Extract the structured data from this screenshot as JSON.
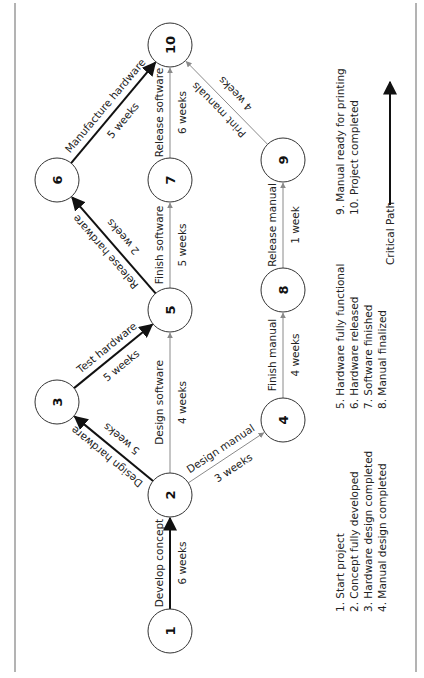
{
  "diagram": {
    "orientation": "rotated -90deg",
    "colors": {
      "critical": "#111111",
      "normal": "#8a8a8a",
      "node_stroke": "#333333",
      "border": "#9a9a9a"
    },
    "nodes": [
      {
        "id": "1",
        "x": 170,
        "y": 631
      },
      {
        "id": "2",
        "x": 170,
        "y": 495
      },
      {
        "id": "3",
        "x": 57,
        "y": 402
      },
      {
        "id": "4",
        "x": 283,
        "y": 420
      },
      {
        "id": "5",
        "x": 170,
        "y": 310
      },
      {
        "id": "6",
        "x": 57,
        "y": 180
      },
      {
        "id": "7",
        "x": 170,
        "y": 180
      },
      {
        "id": "8",
        "x": 283,
        "y": 290
      },
      {
        "id": "9",
        "x": 283,
        "y": 160
      },
      {
        "id": "10",
        "x": 170,
        "y": 45
      }
    ],
    "node_radius": 22,
    "edges": [
      {
        "from": "1",
        "to": "2",
        "task": "Develop concept",
        "duration": "6 weeks",
        "critical": true
      },
      {
        "from": "2",
        "to": "3",
        "task": "Design hardware",
        "duration": "5 weeks",
        "critical": true
      },
      {
        "from": "2",
        "to": "5",
        "task": "Design software",
        "duration": "4 weeks",
        "critical": false
      },
      {
        "from": "2",
        "to": "4",
        "task": "Design manual",
        "duration": "3 weeks",
        "critical": false
      },
      {
        "from": "3",
        "to": "5",
        "task": "Test hardware",
        "duration": "5 weeks",
        "critical": true
      },
      {
        "from": "5",
        "to": "6",
        "task": "Release hardware",
        "duration": "2 weeks",
        "critical": true
      },
      {
        "from": "5",
        "to": "7",
        "task": "Finish software",
        "duration": "5 weeks",
        "critical": false
      },
      {
        "from": "4",
        "to": "8",
        "task": "Finish manual",
        "duration": "4 weeks",
        "critical": false
      },
      {
        "from": "8",
        "to": "9",
        "task": "Release manual",
        "duration": "1 week",
        "critical": false
      },
      {
        "from": "6",
        "to": "10",
        "task": "Manufacture hardware",
        "duration": "5 weeks",
        "critical": true
      },
      {
        "from": "7",
        "to": "10",
        "task": "Release software",
        "duration": "6 weeks",
        "critical": false
      },
      {
        "from": "9",
        "to": "10",
        "task": "Print manuals",
        "duration": "4 weeks",
        "critical": false
      }
    ],
    "legend": {
      "column1": [
        "1. Start project",
        "2. Concept fully developed",
        "3. Hardware design completed",
        "4. Manual design completed"
      ],
      "column2": [
        "5. Hardware fully functional",
        "6. Hardware released",
        "7. Software finished",
        "8. Manual finalized"
      ],
      "column3": [
        "9. Manual ready for printing",
        "10. Project completed"
      ],
      "critical_path_label": "Critical Path"
    }
  }
}
